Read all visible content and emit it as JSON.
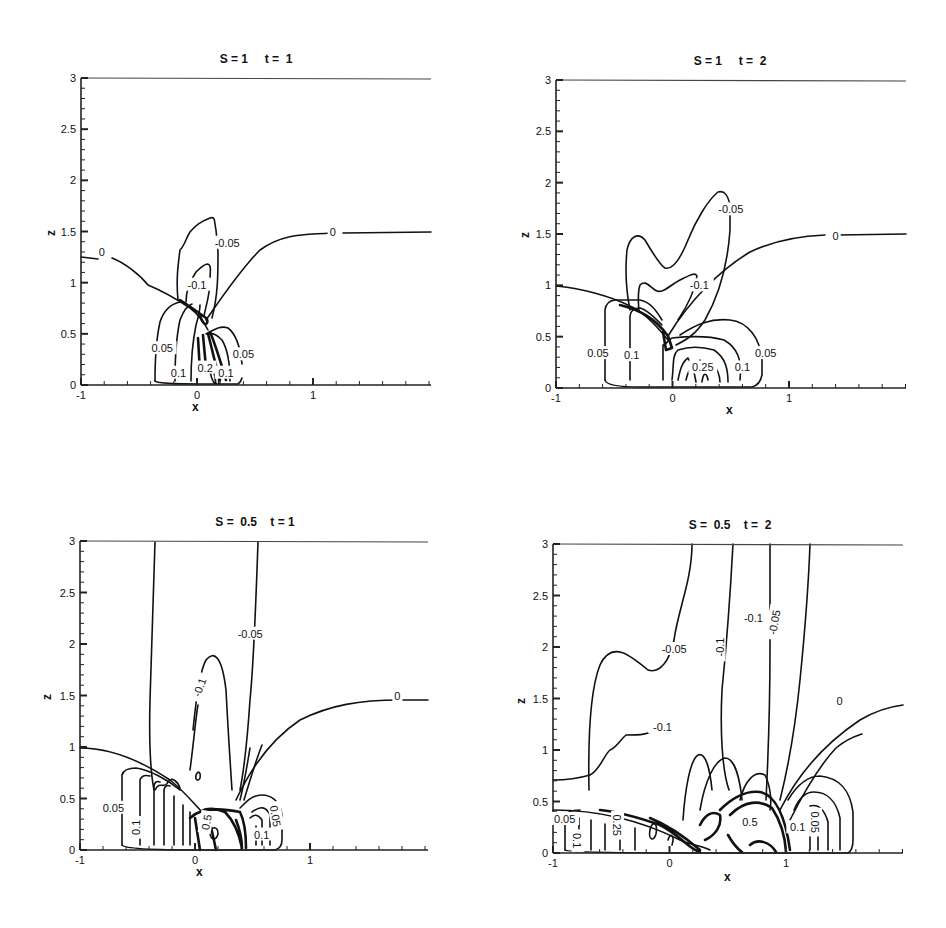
{
  "header": {
    "fragments": [
      "'",
      "'"
    ]
  },
  "panels": [
    {
      "id": "p1",
      "title": "S = 1     t =  1",
      "origin": {
        "x0": 81,
        "x1": 196,
        "x2": 313,
        "xr": 431,
        "y0": 385,
        "y3": 78
      },
      "xlabel": "x",
      "ylabel": "z",
      "xticks": [
        "-1",
        "0",
        "1"
      ],
      "yticks": [
        "0",
        "0.5",
        "1",
        "1.5",
        "2",
        "2.5",
        "3"
      ],
      "labels": [
        {
          "text": "0",
          "x": -0.82,
          "z": 1.3,
          "rot": 0
        },
        {
          "text": "0",
          "x": 1.17,
          "z": 1.5,
          "rot": 0
        },
        {
          "text": "-0.05",
          "x": 0.26,
          "z": 1.39,
          "rot": 0
        },
        {
          "text": "-0.1",
          "x": 0.0,
          "z": 0.98,
          "rot": 0
        },
        {
          "text": "0.05",
          "x": -0.3,
          "z": 0.36,
          "rot": 0
        },
        {
          "text": "0.05",
          "x": 0.4,
          "z": 0.3,
          "rot": 0
        },
        {
          "text": "0.1",
          "x": -0.16,
          "z": 0.12,
          "rot": 0
        },
        {
          "text": "0.2",
          "x": 0.07,
          "z": 0.17,
          "rot": 0
        },
        {
          "text": "0.1",
          "x": 0.25,
          "z": 0.12,
          "rot": 0
        }
      ]
    },
    {
      "id": "p2",
      "title": "S = 1     t =  2",
      "origin": {
        "x0": 556,
        "x1": 672,
        "x2": 789,
        "xr": 906,
        "y0": 388,
        "y3": 80
      },
      "xlabel": "x",
      "ylabel": "z",
      "xticks": [
        "-1",
        "0",
        "1"
      ],
      "yticks": [
        "0",
        "0.5",
        "1",
        "1.5",
        "2",
        "2.5",
        "3"
      ],
      "labels": [
        {
          "text": "0",
          "x": 1.4,
          "z": 1.48,
          "rot": 0
        },
        {
          "text": "-0.05",
          "x": 0.5,
          "z": 1.74,
          "rot": 0
        },
        {
          "text": "-0.1",
          "x": 0.23,
          "z": 1.0,
          "rot": 0
        },
        {
          "text": "0.05",
          "x": -0.64,
          "z": 0.34,
          "rot": 0
        },
        {
          "text": "0.1",
          "x": -0.35,
          "z": 0.32,
          "rot": 0
        },
        {
          "text": "0.25",
          "x": 0.26,
          "z": 0.2,
          "rot": 0
        },
        {
          "text": "0.1",
          "x": 0.6,
          "z": 0.2,
          "rot": 0
        },
        {
          "text": "0.05",
          "x": 0.8,
          "z": 0.34,
          "rot": 0
        }
      ]
    },
    {
      "id": "p3",
      "title": "S =  0.5    t = 1",
      "origin": {
        "x0": 80,
        "x1": 194,
        "x2": 310,
        "xr": 428,
        "y0": 850,
        "y3": 541
      },
      "xlabel": "x",
      "ylabel": "z",
      "xticks": [
        "-1",
        "0",
        "1"
      ],
      "yticks": [
        "0",
        "0.5",
        "1",
        "1.5",
        "2",
        "2.5",
        "3"
      ],
      "labels": [
        {
          "text": "-0.05",
          "x": 0.48,
          "z": 2.1,
          "rot": 0
        },
        {
          "text": "-0.1",
          "x": 0.04,
          "z": 1.58,
          "rot": -70
        },
        {
          "text": "0",
          "x": 1.76,
          "z": 1.5,
          "rot": 0
        },
        {
          "text": "0.05",
          "x": -0.71,
          "z": 0.41,
          "rot": 0
        },
        {
          "text": "0.1",
          "x": -0.51,
          "z": 0.22,
          "rot": -90
        },
        {
          "text": "0.5",
          "x": 0.1,
          "z": 0.27,
          "rot": -80
        },
        {
          "text": "0.1",
          "x": 0.58,
          "z": 0.15,
          "rot": 0
        },
        {
          "text": "0.05",
          "x": 0.7,
          "z": 0.33,
          "rot": 80
        }
      ]
    },
    {
      "id": "p4",
      "title": "S =  0.5    t =  2",
      "origin": {
        "x0": 553,
        "x1": 669,
        "x2": 786,
        "xr": 903,
        "y0": 853,
        "y3": 544
      },
      "xlabel": "x",
      "ylabel": "z",
      "xticks": [
        "-1",
        "0",
        "1"
      ],
      "yticks": [
        "0",
        "0.5",
        "1",
        "1.5",
        "2",
        "2.5",
        "3"
      ],
      "labels": [
        {
          "text": "-0.05",
          "x": 0.04,
          "z": 1.98,
          "rot": 0
        },
        {
          "text": "-0.1",
          "x": 0.43,
          "z": 2.0,
          "rot": -90
        },
        {
          "text": "-0.1",
          "x": 0.72,
          "z": 2.28,
          "rot": 0
        },
        {
          "text": "-0.05",
          "x": 0.9,
          "z": 2.24,
          "rot": -80
        },
        {
          "text": "0",
          "x": 1.46,
          "z": 1.48,
          "rot": 0
        },
        {
          "text": "-0.1",
          "x": -0.06,
          "z": 1.22,
          "rot": 0
        },
        {
          "text": "0.05",
          "x": -0.9,
          "z": 0.33,
          "rot": 0
        },
        {
          "text": "0.1",
          "x": -0.79,
          "z": 0.12,
          "rot": 90
        },
        {
          "text": "0.25",
          "x": -0.45,
          "z": 0.27,
          "rot": 90
        },
        {
          "text": "0.5",
          "x": 0.69,
          "z": 0.3,
          "rot": 0
        },
        {
          "text": "0.1",
          "x": 1.1,
          "z": 0.25,
          "rot": 0
        },
        {
          "text": "0.05",
          "x": 1.25,
          "z": 0.3,
          "rot": 90
        }
      ]
    }
  ],
  "chart_data": [
    {
      "type": "contour",
      "title": "S = 1  t = 1",
      "xlabel": "x",
      "ylabel": "z",
      "xlim": [
        -1,
        2
      ],
      "ylim": [
        0,
        3
      ],
      "xticks": [
        -1,
        0,
        1
      ],
      "yticks": [
        0,
        0.5,
        1,
        1.5,
        2,
        2.5,
        3
      ],
      "levels": [
        -0.1,
        -0.05,
        0,
        0.05,
        0.1,
        0.2
      ],
      "contour_labels": [
        "0",
        "0",
        "-0.05",
        "-0.1",
        "0.05",
        "0.05",
        "0.1",
        "0.2",
        "0.1"
      ],
      "features": {
        "zero_contour_far_left_z": 1.3,
        "zero_contour_far_right_z": 1.5,
        "neg_lobe_peak_z": 1.62,
        "pos_region_x": [
          -0.35,
          0.4
        ],
        "pos_region_top_z": 0.8
      }
    },
    {
      "type": "contour",
      "title": "S = 1  t = 2",
      "xlabel": "x",
      "ylabel": "z",
      "xlim": [
        -1,
        2
      ],
      "ylim": [
        0,
        3
      ],
      "xticks": [
        -1,
        0,
        1
      ],
      "yticks": [
        0,
        0.5,
        1,
        1.5,
        2,
        2.5,
        3
      ],
      "levels": [
        -0.1,
        -0.05,
        0,
        0.05,
        0.1,
        0.25
      ],
      "contour_labels": [
        "0",
        "-0.05",
        "-0.1",
        "0.05",
        "0.1",
        "0.25",
        "0.1",
        "0.05"
      ],
      "features": {
        "zero_contour_far_left_z": 1.0,
        "zero_contour_far_right_z": 1.5,
        "neg_lobe_peak_z": 2.0,
        "pos_region_x": [
          -0.65,
          0.82
        ],
        "pos_region_top_z": 0.85
      }
    },
    {
      "type": "contour",
      "title": "S = 0.5  t = 1",
      "xlabel": "x",
      "ylabel": "z",
      "xlim": [
        -1,
        2
      ],
      "ylim": [
        0,
        3
      ],
      "xticks": [
        -1,
        0,
        1
      ],
      "yticks": [
        0,
        0.5,
        1,
        1.5,
        2,
        2.5,
        3
      ],
      "levels": [
        -0.1,
        -0.05,
        0,
        0.05,
        0.1,
        0.5
      ],
      "contour_labels": [
        "-0.05",
        "-0.1",
        "0",
        "0.05",
        "0.1",
        "0.5",
        "0.1",
        "0.05"
      ],
      "features": {
        "zero_contour_far_left_z": 1.0,
        "zero_contour_far_right_z": 1.5,
        "neg_lobe_peak_z": 1.82,
        "pos_region_x": [
          -0.65,
          0.72
        ],
        "pos_region_top_z": 0.9
      }
    },
    {
      "type": "contour",
      "title": "S = 0.5  t = 2",
      "xlabel": "x",
      "ylabel": "z",
      "xlim": [
        -1,
        2
      ],
      "ylim": [
        0,
        3
      ],
      "xticks": [
        -1,
        0,
        1
      ],
      "yticks": [
        0,
        0.5,
        1,
        1.5,
        2,
        2.5,
        3
      ],
      "levels": [
        -0.1,
        -0.05,
        0,
        0.05,
        0.1,
        0.25,
        0.5
      ],
      "contour_labels": [
        "-0.05",
        "-0.1",
        "-0.1",
        "-0.05",
        "0",
        "-0.1",
        "0.05",
        "0.1",
        "0.25",
        "0.5",
        "0.1",
        "0.05"
      ],
      "features": {
        "zero_contour_far_left_z": 0.78,
        "zero_contour_far_right_z": 1.5,
        "neg_lobe_peak_z": 2.15,
        "pos_region_x": [
          -0.95,
          1.27
        ],
        "pos_region_top_z": 0.78
      }
    }
  ]
}
